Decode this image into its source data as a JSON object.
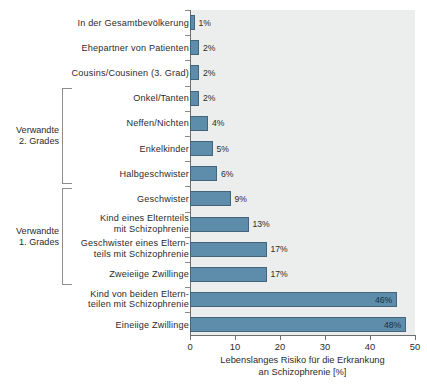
{
  "chart_data": {
    "type": "bar",
    "orientation": "horizontal",
    "title": "",
    "xlabel": "Lebenslanges Risiko für die Erkrankung\nan Schizophrenie [%]",
    "ylabel": "",
    "xlim": [
      0,
      50
    ],
    "xticks": [
      0,
      10,
      20,
      30,
      40,
      50
    ],
    "xtick_labels": [
      "0",
      "10",
      "20",
      "30",
      "40",
      "50"
    ],
    "grid": false,
    "legend": false,
    "value_suffix": "%",
    "bar_color": "#5e8dab",
    "bar_edge_color": "#43647a",
    "plot_background": "#eceded",
    "categories": [
      "In der Gesamtbevölkerung",
      "Ehepartner von Patienten",
      "Cousins/Cousinen (3. Grad)",
      "Onkel/Tanten",
      "Neffen/Nichten",
      "Enkelkinder",
      "Halbgeschwister",
      "Geschwister",
      "Kind eines Elternteils\nmit Schizophrenie",
      "Geschwister eines Eltern-\nteils mit Schizophrenie",
      "Zweieiige Zwillinge",
      "Kind von beiden Eltern-\nteilen mit Schizophrenie",
      "Eineiige Zwillinge"
    ],
    "values": [
      1,
      2,
      2,
      2,
      4,
      5,
      6,
      9,
      13,
      17,
      17,
      46,
      48
    ],
    "value_labels": [
      "1%",
      "2%",
      "2%",
      "2%",
      "4%",
      "5%",
      "6%",
      "9%",
      "13%",
      "17%",
      "17%",
      "46%",
      "48%"
    ],
    "label_inside": [
      false,
      false,
      false,
      false,
      false,
      false,
      false,
      false,
      false,
      false,
      false,
      true,
      true
    ]
  },
  "groups": [
    {
      "label": "Verwandte\n2. Grades",
      "first_index": 3,
      "last_index": 6
    },
    {
      "label": "Verwandte\n1. Grades",
      "first_index": 7,
      "last_index": 10
    }
  ]
}
